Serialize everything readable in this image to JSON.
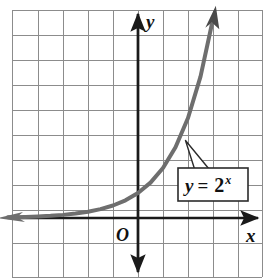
{
  "chart_data": {
    "type": "line",
    "title": "",
    "xlabel": "x",
    "ylabel": "y",
    "function_label": "y = 2",
    "function_exponent": "x",
    "equation_text": "y = 2^x",
    "origin_label": "O",
    "grid": true,
    "grid_columns": 10,
    "grid_rows": 11,
    "grid_step": 1,
    "xlim": [
      -5.2,
      5.0
    ],
    "ylim": [
      -2.4,
      8.3
    ],
    "axis_arrows": [
      "left",
      "right",
      "up",
      "down"
    ],
    "curve_arrows": [
      "left",
      "up-right"
    ],
    "series": [
      {
        "name": "y = 2^x",
        "color": "#6e6e6e",
        "x": [
          -5.2,
          -4.5,
          -4,
          -3.5,
          -3,
          -2.5,
          -2,
          -1.5,
          -1,
          -0.5,
          0,
          0.5,
          1,
          1.5,
          2,
          2.5,
          2.95
        ],
        "y": [
          0.027,
          0.044,
          0.0625,
          0.088,
          0.125,
          0.177,
          0.25,
          0.354,
          0.5,
          0.707,
          1,
          1.414,
          2,
          2.828,
          4,
          5.657,
          7.73
        ]
      }
    ],
    "annotations": [
      {
        "text": "y = 2^x",
        "target_point": {
          "x": 1.9,
          "y": 3.1
        },
        "box_x_range": [
          1.6,
          4.4
        ],
        "box_y_range": [
          0.7,
          2.0
        ]
      }
    ],
    "colors": {
      "grid_line": "#8c8c8c",
      "grid_border": "#6f6f6f",
      "axis": "#1a1a1a",
      "curve": "#6e6e6e",
      "label_box_fill": "#ffffff",
      "label_box_border": "#2b2b2b",
      "text": "#111111",
      "background": "#ffffff"
    }
  }
}
